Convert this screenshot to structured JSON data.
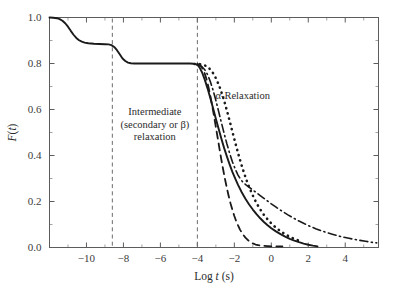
{
  "chart_data": {
    "type": "line",
    "title": "",
    "xlabel": "Log t (s)",
    "ylabel": "F(t)",
    "xlim": [
      -12.0,
      5.8
    ],
    "ylim": [
      0.0,
      1.0
    ],
    "grid": false,
    "legend_position": "none",
    "x_ticks": [
      -10,
      -8,
      -6,
      -4,
      -2,
      0,
      2,
      4
    ],
    "x_tick_labels": [
      "-10",
      "-8",
      "-6",
      "-4",
      "-2",
      "0",
      "2",
      "4"
    ],
    "x_minor_ticks": [
      -11,
      -9,
      -7,
      -5,
      -3,
      -1,
      1,
      3,
      5
    ],
    "y_ticks": [
      0.0,
      0.2,
      0.4,
      0.6,
      0.8,
      1.0
    ],
    "y_tick_labels": [
      "0.0",
      "0.2",
      "0.4",
      "0.6",
      "0.8",
      "1.0"
    ],
    "y_minor_ticks": [
      0.1,
      0.3,
      0.5,
      0.7,
      0.9
    ],
    "reference_lines": [
      {
        "name": "beta-onset",
        "x": -8.6,
        "style": "dashed"
      },
      {
        "name": "alpha-onset",
        "x": -4.0,
        "style": "dashed"
      }
    ],
    "annotations": [
      {
        "name": "intermediate-relaxation-label",
        "lines": [
          "Intermediate",
          "(secondary or β)",
          "relaxation"
        ],
        "x": -6.3,
        "y": 0.575
      },
      {
        "name": "alpha-relaxation-label",
        "lines": [
          "α-Relaxation"
        ],
        "x": -1.55,
        "y": 0.645
      }
    ],
    "series": [
      {
        "name": "full-relaxation-solid",
        "style": "solid",
        "color": "#1a1a1a",
        "points": [
          [
            -12.0,
            1.0
          ],
          [
            -11.8,
            0.999
          ],
          [
            -11.6,
            0.997
          ],
          [
            -11.45,
            0.993
          ],
          [
            -11.3,
            0.986
          ],
          [
            -11.15,
            0.975
          ],
          [
            -11.0,
            0.96
          ],
          [
            -10.85,
            0.942
          ],
          [
            -10.7,
            0.925
          ],
          [
            -10.55,
            0.911
          ],
          [
            -10.4,
            0.901
          ],
          [
            -10.25,
            0.895
          ],
          [
            -10.1,
            0.891
          ],
          [
            -9.9,
            0.888
          ],
          [
            -9.6,
            0.886
          ],
          [
            -9.3,
            0.885
          ],
          [
            -9.0,
            0.884
          ],
          [
            -8.8,
            0.883
          ],
          [
            -8.65,
            0.88
          ],
          [
            -8.5,
            0.872
          ],
          [
            -8.35,
            0.858
          ],
          [
            -8.2,
            0.84
          ],
          [
            -8.05,
            0.822
          ],
          [
            -7.9,
            0.811
          ],
          [
            -7.75,
            0.804
          ],
          [
            -7.6,
            0.801
          ],
          [
            -7.4,
            0.8
          ],
          [
            -7.0,
            0.8
          ],
          [
            -6.0,
            0.8
          ],
          [
            -5.0,
            0.8
          ],
          [
            -4.4,
            0.8
          ],
          [
            -4.2,
            0.799
          ],
          [
            -4.05,
            0.796
          ],
          [
            -3.95,
            0.79
          ],
          [
            -3.85,
            0.778
          ],
          [
            -3.75,
            0.762
          ],
          [
            -3.6,
            0.73
          ],
          [
            -3.45,
            0.692
          ],
          [
            -3.3,
            0.65
          ],
          [
            -3.15,
            0.605
          ],
          [
            -3.0,
            0.56
          ],
          [
            -2.85,
            0.516
          ],
          [
            -2.7,
            0.473
          ],
          [
            -2.55,
            0.432
          ],
          [
            -2.4,
            0.395
          ],
          [
            -2.25,
            0.36
          ],
          [
            -2.1,
            0.328
          ],
          [
            -1.95,
            0.299
          ],
          [
            -1.8,
            0.272
          ],
          [
            -1.6,
            0.24
          ],
          [
            -1.4,
            0.212
          ],
          [
            -1.2,
            0.187
          ],
          [
            -1.0,
            0.165
          ],
          [
            -0.8,
            0.145
          ],
          [
            -0.6,
            0.127
          ],
          [
            -0.4,
            0.111
          ],
          [
            -0.2,
            0.097
          ],
          [
            0.0,
            0.084
          ],
          [
            0.25,
            0.07
          ],
          [
            0.5,
            0.058
          ],
          [
            0.75,
            0.047
          ],
          [
            1.0,
            0.038
          ],
          [
            1.25,
            0.03
          ],
          [
            1.5,
            0.023
          ],
          [
            1.75,
            0.017
          ],
          [
            2.0,
            0.012
          ],
          [
            2.25,
            0.008
          ],
          [
            2.5,
            0.005
          ]
        ]
      },
      {
        "name": "alpha-relaxation-dotted",
        "style": "dotted",
        "color": "#1a1a1a",
        "points": [
          [
            -4.15,
            0.798
          ],
          [
            -4.0,
            0.798
          ],
          [
            -3.85,
            0.797
          ],
          [
            -3.7,
            0.795
          ],
          [
            -3.55,
            0.79
          ],
          [
            -3.4,
            0.782
          ],
          [
            -3.25,
            0.77
          ],
          [
            -3.1,
            0.752
          ],
          [
            -2.95,
            0.728
          ],
          [
            -2.8,
            0.699
          ],
          [
            -2.65,
            0.664
          ],
          [
            -2.5,
            0.624
          ],
          [
            -2.35,
            0.58
          ],
          [
            -2.2,
            0.534
          ],
          [
            -2.05,
            0.487
          ],
          [
            -1.9,
            0.441
          ],
          [
            -1.75,
            0.397
          ],
          [
            -1.6,
            0.356
          ],
          [
            -1.45,
            0.318
          ],
          [
            -1.3,
            0.284
          ],
          [
            -1.15,
            0.253
          ],
          [
            -1.0,
            0.226
          ],
          [
            -0.85,
            0.201
          ],
          [
            -0.7,
            0.179
          ],
          [
            -0.55,
            0.16
          ],
          [
            -0.4,
            0.142
          ],
          [
            -0.25,
            0.127
          ],
          [
            -0.1,
            0.113
          ],
          [
            0.1,
            0.097
          ],
          [
            0.3,
            0.083
          ],
          [
            0.5,
            0.071
          ],
          [
            0.7,
            0.06
          ],
          [
            0.9,
            0.051
          ],
          [
            1.1,
            0.043
          ],
          [
            1.3,
            0.036
          ],
          [
            1.5,
            0.03
          ]
        ]
      },
      {
        "name": "fast-relaxation-dashed",
        "style": "dashed",
        "color": "#1a1a1a",
        "points": [
          [
            -4.0,
            0.798
          ],
          [
            -3.9,
            0.795
          ],
          [
            -3.8,
            0.788
          ],
          [
            -3.7,
            0.775
          ],
          [
            -3.6,
            0.756
          ],
          [
            -3.5,
            0.73
          ],
          [
            -3.4,
            0.698
          ],
          [
            -3.3,
            0.66
          ],
          [
            -3.2,
            0.618
          ],
          [
            -3.1,
            0.572
          ],
          [
            -3.0,
            0.524
          ],
          [
            -2.9,
            0.476
          ],
          [
            -2.8,
            0.428
          ],
          [
            -2.7,
            0.381
          ],
          [
            -2.6,
            0.337
          ],
          [
            -2.5,
            0.295
          ],
          [
            -2.4,
            0.257
          ],
          [
            -2.3,
            0.222
          ],
          [
            -2.2,
            0.19
          ],
          [
            -2.1,
            0.162
          ],
          [
            -2.0,
            0.137
          ],
          [
            -1.9,
            0.115
          ],
          [
            -1.8,
            0.096
          ],
          [
            -1.7,
            0.079
          ],
          [
            -1.6,
            0.065
          ],
          [
            -1.5,
            0.053
          ],
          [
            -1.4,
            0.043
          ],
          [
            -1.3,
            0.035
          ],
          [
            -1.2,
            0.028
          ],
          [
            -1.1,
            0.022
          ],
          [
            -1.0,
            0.018
          ],
          [
            -0.85,
            0.013
          ],
          [
            -0.7,
            0.01
          ],
          [
            -0.55,
            0.008
          ],
          [
            -0.4,
            0.007
          ],
          [
            -0.2,
            0.006
          ],
          [
            0.0,
            0.005
          ],
          [
            0.3,
            0.005
          ],
          [
            0.6,
            0.005
          ]
        ]
      },
      {
        "name": "slow-relaxation-dashdot",
        "style": "dashdot",
        "color": "#1a1a1a",
        "points": [
          [
            -3.9,
            0.793
          ],
          [
            -3.75,
            0.786
          ],
          [
            -3.6,
            0.773
          ],
          [
            -3.45,
            0.752
          ],
          [
            -3.3,
            0.722
          ],
          [
            -3.15,
            0.684
          ],
          [
            -3.0,
            0.64
          ],
          [
            -2.85,
            0.592
          ],
          [
            -2.7,
            0.543
          ],
          [
            -2.55,
            0.495
          ],
          [
            -2.4,
            0.45
          ],
          [
            -2.25,
            0.409
          ],
          [
            -2.1,
            0.372
          ],
          [
            -1.95,
            0.341
          ],
          [
            -1.8,
            0.315
          ],
          [
            -1.65,
            0.295
          ],
          [
            -1.5,
            0.281
          ],
          [
            -1.35,
            0.271
          ],
          [
            -1.2,
            0.262
          ],
          [
            -1.0,
            0.25
          ],
          [
            -0.8,
            0.238
          ],
          [
            -0.6,
            0.226
          ],
          [
            -0.4,
            0.214
          ],
          [
            -0.2,
            0.202
          ],
          [
            0.0,
            0.19
          ],
          [
            0.3,
            0.173
          ],
          [
            0.6,
            0.157
          ],
          [
            0.9,
            0.142
          ],
          [
            1.2,
            0.128
          ],
          [
            1.5,
            0.115
          ],
          [
            1.8,
            0.103
          ],
          [
            2.1,
            0.092
          ],
          [
            2.4,
            0.082
          ],
          [
            2.7,
            0.073
          ],
          [
            3.0,
            0.065
          ],
          [
            3.3,
            0.058
          ],
          [
            3.6,
            0.051
          ],
          [
            3.9,
            0.045
          ],
          [
            4.2,
            0.04
          ],
          [
            4.5,
            0.035
          ],
          [
            4.8,
            0.031
          ],
          [
            5.1,
            0.027
          ],
          [
            5.4,
            0.023
          ],
          [
            5.7,
            0.02
          ]
        ]
      }
    ]
  }
}
